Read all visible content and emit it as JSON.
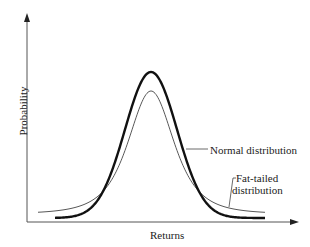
{
  "chart_data": {
    "type": "line",
    "title": "",
    "xlabel": "Returns",
    "ylabel": "Probability",
    "grid": false,
    "legend": "annotations",
    "series": [
      {
        "name": "Normal distribution",
        "style": "thick",
        "description": "taller peak, thinner tails",
        "peak_relative": 1.0,
        "tail_relative": 0.04
      },
      {
        "name": "Fat-tailed distribution",
        "style": "thin",
        "description": "lower peak, fatter tails",
        "peak_relative": 0.87,
        "tail_relative": 0.07
      }
    ],
    "annotations": [
      {
        "text": "Normal distribution",
        "points_to": "thick curve"
      },
      {
        "text": "Fat-tailed\ndistribution",
        "points_to": "thin curve tail"
      }
    ]
  },
  "labels": {
    "ylabel": "Probability",
    "xlabel": "Returns",
    "normal": "Normal distribution",
    "fat_line1": "Fat-tailed",
    "fat_line2": "distribution"
  }
}
